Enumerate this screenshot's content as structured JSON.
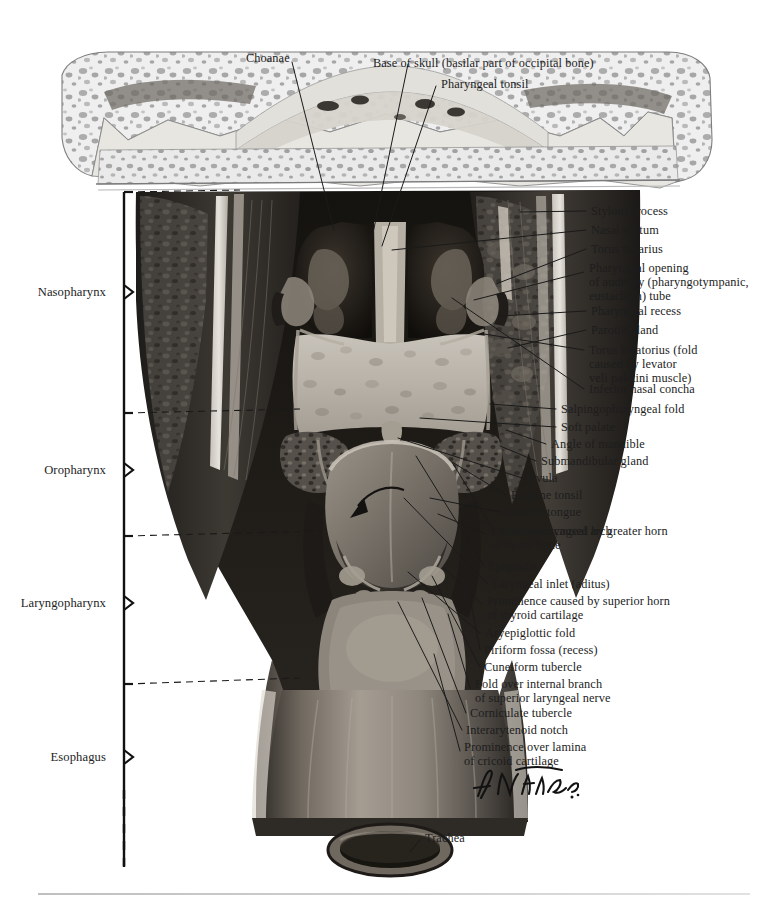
{
  "figure": {
    "artist_signature": "F. Netter"
  },
  "top_labels": [
    {
      "id": "choanae",
      "text": "Choanae",
      "x": 246,
      "y": 51
    },
    {
      "id": "base-of-skull",
      "text": "Base of skull (basilar part of occipital bone)",
      "x": 373,
      "y": 56
    },
    {
      "id": "pharyngeal-tonsil",
      "text": "Pharyngeal tonsil",
      "x": 441,
      "y": 77
    }
  ],
  "right_labels": [
    {
      "id": "styloid-process",
      "text": "Styloid process",
      "x": 591,
      "y": 211
    },
    {
      "id": "nasal-septum",
      "text": "Nasal septum",
      "x": 591,
      "y": 230
    },
    {
      "id": "torus-tubarius",
      "text": "Torus tubarius",
      "x": 591,
      "y": 249
    },
    {
      "id": "pharyngeal-opening-auditory-tube",
      "text": "Pharyngeal opening\nof auditory (pharyngotympanic,\neustachian) tube",
      "x": 589,
      "y": 268
    },
    {
      "id": "pharyngeal-recess",
      "text": "Pharyngeal recess",
      "x": 591,
      "y": 311
    },
    {
      "id": "parotid-gland",
      "text": "Parotid gland",
      "x": 591,
      "y": 330
    },
    {
      "id": "torus-levatorius",
      "text": "Torus levatorius (fold\ncaused by levator\nveli palatini muscle)",
      "x": 589,
      "y": 346
    },
    {
      "id": "inferior-nasal-concha",
      "text": "Inferior nasal concha",
      "x": 589,
      "y": 388
    },
    {
      "id": "salpingopharyngeal-fold",
      "text": "Salpingopharyngeal fold",
      "x": 561,
      "y": 408
    },
    {
      "id": "soft-palate",
      "text": "Soft palate",
      "x": 561,
      "y": 426
    },
    {
      "id": "angle-of-mandible",
      "text": "Angle of mandible",
      "x": 551,
      "y": 443
    },
    {
      "id": "submandibular-gland",
      "text": "Submandibular gland",
      "x": 541,
      "y": 460
    },
    {
      "id": "uvula",
      "text": "Uvula",
      "x": 527,
      "y": 477
    },
    {
      "id": "palatine-tonsil",
      "text": "Palatine tonsil",
      "x": 511,
      "y": 494
    },
    {
      "id": "root-of-tongue",
      "text": "Root of tongue",
      "x": 506,
      "y": 511
    },
    {
      "id": "palatopharyngeal-arch",
      "text": "Palatopharyngeal arch",
      "x": 500,
      "y": 530
    },
    {
      "id": "prominence-greater-horn-hyoid",
      "text": "Prominence caused by greater horn\nof hyoid bone",
      "x": 491,
      "y": 529
    },
    {
      "id": "epiglottis",
      "text": "Epiglottis",
      "x": 488,
      "y": 565
    },
    {
      "id": "laryngeal-inlet",
      "text": "Laryngeal inlet (aditus)",
      "x": 492,
      "y": 583
    },
    {
      "id": "prominence-superior-horn-thyroid",
      "text": "Prominence caused by superior horn\nof thyroid cartilage",
      "x": 487,
      "y": 600
    },
    {
      "id": "aryepiglottic-fold",
      "text": "Aryepiglottic fold",
      "x": 485,
      "y": 632
    },
    {
      "id": "piriform-fossa",
      "text": "Piriform fossa (recess)",
      "x": 484,
      "y": 649
    },
    {
      "id": "cuneiform-tubercle",
      "text": "Cuneiform tubercle",
      "x": 484,
      "y": 666
    },
    {
      "id": "fold-internal-branch-laryngeal-nerve",
      "text": "Fold over internal branch\nof superior laryngeal nerve",
      "x": 475,
      "y": 682
    },
    {
      "id": "corniculate-tubercle",
      "text": "Corniculate tubercle",
      "x": 470,
      "y": 712
    },
    {
      "id": "interarytenoid-notch",
      "text": "Interarytenoid notch",
      "x": 466,
      "y": 729
    },
    {
      "id": "prominence-lamina-cricoid",
      "text": "Prominence over lamina\nof cricoid cartilage",
      "x": 464,
      "y": 746
    },
    {
      "id": "trachea",
      "text": "Trachea",
      "x": 425,
      "y": 837
    }
  ],
  "region_labels": [
    {
      "id": "nasopharynx",
      "text": "Nasopharynx",
      "x": 108,
      "y": 292
    },
    {
      "id": "oropharynx",
      "text": "Oropharynx",
      "x": 108,
      "y": 470
    },
    {
      "id": "laryngopharynx",
      "text": "Laryngopharynx",
      "x": 108,
      "y": 603
    },
    {
      "id": "esophagus",
      "text": "Esophagus",
      "x": 108,
      "y": 757
    }
  ],
  "colors": {
    "bone_light": "#ececec",
    "bone_speckle": "#9a9a9a",
    "mucosa_pale": "#c9c5bd",
    "mucosa_mid": "#8f8a83",
    "tissue_dark": "#2a2724",
    "leader_line": "#1a1a1a",
    "text": "#1d1d1d",
    "rule": "#bdbdbd"
  }
}
